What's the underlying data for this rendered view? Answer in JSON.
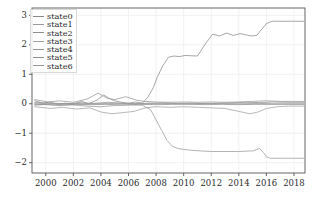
{
  "chart_data": {
    "type": "line",
    "title": "",
    "xlabel": "",
    "ylabel": "",
    "xlim": [
      1999.0,
      2018.8
    ],
    "ylim": [
      -2.35,
      3.25
    ],
    "grid": true,
    "legend_position": "upper-left",
    "xticks": [
      "2000",
      "2002",
      "2004",
      "2006",
      "2008",
      "2010",
      "2012",
      "2014",
      "2016",
      "2018"
    ],
    "xtick_values": [
      2000,
      2002,
      2004,
      2006,
      2008,
      2010,
      2012,
      2014,
      2016,
      2018
    ],
    "yticks": [
      "3",
      "2",
      "1",
      "0",
      "−1",
      "−2"
    ],
    "ytick_values": [
      3,
      2,
      1,
      0,
      -1,
      -2
    ],
    "legend": [
      "state0",
      "state1",
      "state2",
      "state3",
      "state4",
      "state5",
      "state6"
    ],
    "colors": {
      "state0": "#8a8a8a",
      "state1": "#9a9a9a",
      "state2": "#8f8f8f",
      "state3": "#a0a0a0",
      "state4": "#959595",
      "state5": "#8d8d8d",
      "state6": "#999999",
      "grid": "#ededed",
      "axis": "#555555",
      "text": "#2a2a2a"
    },
    "series": [
      {
        "name": "state0",
        "color": "#8a8a8a",
        "x": [
          1999.2,
          1999.8,
          2000.3,
          2000.9,
          2001.4,
          2002.0,
          2002.6,
          2003.1,
          2003.7,
          2004.2,
          2004.6,
          2005.0,
          2005.5,
          2006.0,
          2006.5,
          2007.0,
          2007.4,
          2007.8,
          2008.1,
          2008.5,
          2008.9,
          2009.3,
          2009.7,
          2010.1,
          2010.5,
          2011.0,
          2011.6,
          2012.1,
          2012.6,
          2013.1,
          2013.6,
          2014.1,
          2014.5,
          2014.9,
          2015.3,
          2015.7,
          2016.0,
          2016.4,
          2016.9,
          2017.5,
          2018.1,
          2018.7
        ],
        "y": [
          0.1,
          0.02,
          0.06,
          -0.04,
          0.02,
          -0.02,
          0.08,
          0.0,
          0.12,
          0.3,
          0.18,
          0.1,
          0.05,
          0.02,
          0.06,
          0.02,
          0.22,
          0.55,
          0.92,
          1.3,
          1.58,
          1.62,
          1.6,
          1.64,
          1.63,
          1.62,
          2.05,
          2.36,
          2.3,
          2.4,
          2.32,
          2.38,
          2.34,
          2.3,
          2.32,
          2.55,
          2.72,
          2.8,
          2.8,
          2.8,
          2.8,
          2.8
        ]
      },
      {
        "name": "state1",
        "color": "#9a9a9a",
        "x": [
          1999.2,
          2000.0,
          2001.0,
          2002.0,
          2003.0,
          2004.0,
          2005.0,
          2006.0,
          2007.0,
          2007.6,
          2008.0,
          2008.4,
          2008.8,
          2009.2,
          2009.6,
          2010.0,
          2010.6,
          2011.2,
          2012.0,
          2013.0,
          2014.0,
          2015.0,
          2015.5,
          2015.8,
          2016.0,
          2016.3,
          2017.0,
          2018.0,
          2018.7
        ],
        "y": [
          -0.05,
          -0.02,
          -0.06,
          -0.04,
          -0.08,
          -0.1,
          -0.06,
          -0.04,
          -0.05,
          -0.2,
          -0.55,
          -0.9,
          -1.25,
          -1.45,
          -1.52,
          -1.55,
          -1.58,
          -1.6,
          -1.62,
          -1.62,
          -1.62,
          -1.6,
          -1.52,
          -1.66,
          -1.8,
          -1.85,
          -1.85,
          -1.85,
          -1.85
        ]
      },
      {
        "name": "state2",
        "color": "#8f8f8f",
        "x": [
          1999.2,
          2000.5,
          2001.5,
          2002.5,
          2003.5,
          2004.5,
          2005.5,
          2006.5,
          2007.5,
          2008.5,
          2009.5,
          2010.5,
          2011.5,
          2012.5,
          2013.5,
          2014.5,
          2015.5,
          2016.5,
          2017.5,
          2018.7
        ],
        "y": [
          0.04,
          0.02,
          0.0,
          0.03,
          0.01,
          0.05,
          0.02,
          0.0,
          0.02,
          0.03,
          0.01,
          0.02,
          0.0,
          0.02,
          0.03,
          0.05,
          0.04,
          0.06,
          0.05,
          0.05
        ]
      },
      {
        "name": "state3",
        "color": "#a0a0a0",
        "x": [
          1999.2,
          2000.4,
          2001.2,
          2002.2,
          2003.2,
          2004.0,
          2004.8,
          2005.6,
          2006.4,
          2007.2,
          2008.0,
          2009.0,
          2010.0,
          2011.0,
          2012.0,
          2013.0,
          2014.0,
          2014.8,
          2015.4,
          2016.0,
          2016.8,
          2017.6,
          2018.7
        ],
        "y": [
          -0.1,
          -0.16,
          -0.12,
          -0.18,
          -0.14,
          -0.28,
          -0.34,
          -0.3,
          -0.26,
          -0.14,
          -0.1,
          -0.12,
          -0.1,
          -0.12,
          -0.14,
          -0.16,
          -0.26,
          -0.34,
          -0.28,
          -0.16,
          -0.1,
          -0.08,
          -0.08
        ]
      },
      {
        "name": "state4",
        "color": "#959595",
        "x": [
          1999.2,
          2000.2,
          2001.0,
          2002.0,
          2003.0,
          2003.8,
          2004.4,
          2005.0,
          2005.8,
          2006.6,
          2007.2,
          2008.0,
          2009.0,
          2010.0,
          2011.0,
          2012.0,
          2013.0,
          2014.0,
          2015.0,
          2016.0,
          2017.0,
          2018.0,
          2018.7
        ],
        "y": [
          0.14,
          0.06,
          0.1,
          0.05,
          0.16,
          0.36,
          0.2,
          0.14,
          0.24,
          0.12,
          0.08,
          0.06,
          0.05,
          0.06,
          0.05,
          0.06,
          0.05,
          0.06,
          0.08,
          0.1,
          0.08,
          0.08,
          0.08
        ]
      },
      {
        "name": "state5",
        "color": "#8d8d8d",
        "x": [
          1999.2,
          2000.8,
          2002.0,
          2003.2,
          2004.4,
          2005.6,
          2006.8,
          2008.0,
          2009.2,
          2010.4,
          2011.6,
          2012.8,
          2014.0,
          2015.2,
          2016.4,
          2017.6,
          2018.7
        ],
        "y": [
          -0.02,
          -0.04,
          -0.02,
          -0.03,
          -0.02,
          -0.04,
          -0.02,
          -0.03,
          -0.02,
          -0.02,
          -0.03,
          -0.02,
          -0.03,
          -0.02,
          -0.02,
          -0.02,
          -0.02
        ]
      },
      {
        "name": "state6",
        "color": "#999999",
        "x": [
          1999.2,
          2001.0,
          2003.0,
          2005.0,
          2007.0,
          2008.5,
          2010.0,
          2012.0,
          2014.0,
          2015.5,
          2016.5,
          2018.0,
          2018.7
        ],
        "y": [
          0.0,
          0.01,
          0.0,
          0.01,
          0.0,
          0.01,
          0.0,
          0.01,
          0.0,
          0.01,
          0.0,
          0.0,
          0.0
        ]
      }
    ]
  },
  "axes": {
    "left_px": 32,
    "right_px": 305,
    "top_px": 8,
    "bottom_px": 173
  }
}
